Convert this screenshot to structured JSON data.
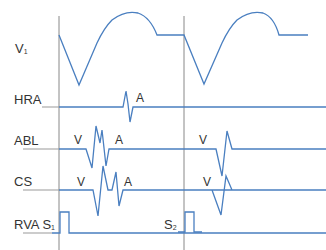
{
  "colors": {
    "trace": "#4a7fc0",
    "baseline_gray": "#999999",
    "marker_line": "#888888",
    "text": "#333333"
  },
  "channels": [
    {
      "name": "V",
      "subscript": "1"
    },
    {
      "name": "HRA",
      "subscript": ""
    },
    {
      "name": "ABL",
      "subscript": ""
    },
    {
      "name": "CS",
      "subscript": ""
    },
    {
      "name": "RVA S",
      "subscript": "1"
    }
  ],
  "stimulus_2": {
    "name": "S",
    "subscript": "2"
  },
  "annotations": {
    "hra_a": "A",
    "abl_v1": "V",
    "abl_a": "A",
    "abl_v2": "V",
    "cs_v1": "V",
    "cs_a": "A",
    "cs_v2": "V"
  }
}
